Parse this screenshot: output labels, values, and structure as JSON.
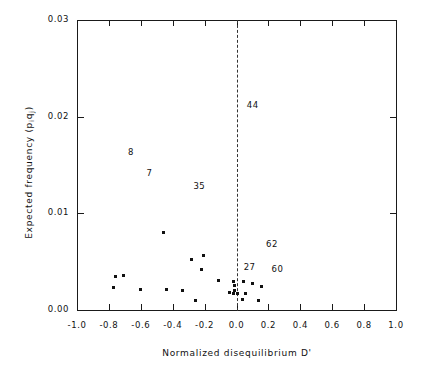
{
  "figure": {
    "background": "#ffffff",
    "ink_color": "#111111"
  },
  "chart_data": {
    "type": "scatter",
    "title": "",
    "xlabel": "Normalized disequilibrium D'",
    "ylabel": "Expected frequency (piqj)",
    "ylabel_parts": {
      "prefix": "Expected frequency (p",
      "sub1": "i",
      "mid": "q",
      "sub2": "j",
      "suffix": ")"
    },
    "xlim": [
      -1.0,
      1.0
    ],
    "ylim": [
      0.0,
      0.03
    ],
    "xticks": [
      -1.0,
      -0.8,
      -0.6,
      -0.4,
      -0.2,
      0.0,
      0.2,
      0.4,
      0.6,
      0.8,
      1.0
    ],
    "xtick_labels": [
      "-1.0",
      "-0.8",
      "-0.6",
      "-0.4",
      "-0.2",
      "0.0",
      "0.2",
      "0.4",
      "0.6",
      "0.8",
      "1.0"
    ],
    "yticks": [
      0.0,
      0.01,
      0.02,
      0.03
    ],
    "ytick_labels": [
      "0.00",
      "0.01",
      "0.02",
      "0.03"
    ],
    "grid": false,
    "legend": null,
    "reference_lines": [
      {
        "orientation": "vertical",
        "x": 0.0,
        "style": "dashed",
        "color": "#333333"
      }
    ],
    "marker": {
      "shape": "square",
      "size_px": 3,
      "color": "#111111"
    },
    "points": [
      {
        "x": -0.46,
        "y": 0.00805
      },
      {
        "x": -0.76,
        "y": 0.00345
      },
      {
        "x": -0.71,
        "y": 0.00355
      },
      {
        "x": -0.77,
        "y": 0.00235
      },
      {
        "x": -0.6,
        "y": 0.00215
      },
      {
        "x": -0.44,
        "y": 0.00215
      },
      {
        "x": -0.34,
        "y": 0.00205
      },
      {
        "x": -0.28,
        "y": 0.0052
      },
      {
        "x": -0.21,
        "y": 0.0056
      },
      {
        "x": -0.22,
        "y": 0.0042
      },
      {
        "x": -0.26,
        "y": 0.001
      },
      {
        "x": -0.11,
        "y": 0.0031
      },
      {
        "x": -0.02,
        "y": 0.00295
      },
      {
        "x": -0.01,
        "y": 0.00255
      },
      {
        "x": -0.01,
        "y": 0.00205
      },
      {
        "x": -0.045,
        "y": 0.00185
      },
      {
        "x": -0.02,
        "y": 0.00175
      },
      {
        "x": 0.005,
        "y": 0.00175
      },
      {
        "x": 0.055,
        "y": 0.00175
      },
      {
        "x": 0.045,
        "y": 0.0029
      },
      {
        "x": 0.1,
        "y": 0.00275
      },
      {
        "x": 0.04,
        "y": 0.00105
      },
      {
        "x": 0.155,
        "y": 0.00245
      },
      {
        "x": 0.14,
        "y": 0.00095
      }
    ],
    "point_labels": [
      {
        "text": "44",
        "x": 0.065,
        "y": 0.0212
      },
      {
        "text": "8",
        "x": -0.68,
        "y": 0.0163
      },
      {
        "text": "7",
        "x": -0.565,
        "y": 0.0142
      },
      {
        "text": "35",
        "x": -0.27,
        "y": 0.0128
      },
      {
        "text": "62",
        "x": 0.185,
        "y": 0.0068
      },
      {
        "text": "27",
        "x": 0.045,
        "y": 0.0044
      },
      {
        "text": "60",
        "x": 0.22,
        "y": 0.0042
      }
    ]
  }
}
